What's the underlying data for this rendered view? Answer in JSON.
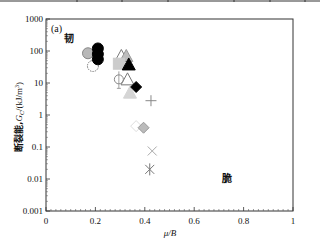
{
  "chart_data": {
    "type": "scatter",
    "panel_label": "(a)",
    "title": "",
    "xlabel": "μ/B",
    "ylabel": "断裂能,Gc/(kJ/m²)",
    "ylabel_prefix": "断裂能,",
    "ylabel_symbol": "G",
    "ylabel_subscript": "C",
    "ylabel_unit": "/(kJ/m",
    "ylabel_sup": "3",
    "ylabel_close": ")",
    "xlim": [
      0,
      1
    ],
    "ylim": [
      0.001,
      1000
    ],
    "yscale": "log",
    "grid": false,
    "legend": "none",
    "x_ticks": [
      "0",
      "0.2",
      "0.4",
      "0.6",
      "0.8",
      "1"
    ],
    "y_ticks": [
      "0.001",
      "0.01",
      "0.1",
      "1",
      "10",
      "100",
      "1000"
    ],
    "annotations": [
      {
        "text": "韧",
        "x": 0.09,
        "y": 200,
        "meaning": "ductile"
      },
      {
        "text": "脆",
        "x": 0.71,
        "y": 0.025,
        "meaning": "brittle"
      }
    ],
    "series": [
      {
        "name": "gray-filled-circle",
        "marker": "circle",
        "fill": "#b8b8b8",
        "stroke": "#888888",
        "points": [
          {
            "x": 0.17,
            "y": 85
          }
        ]
      },
      {
        "name": "open-circle-dashed",
        "marker": "circle",
        "fill": "none",
        "stroke": "#777777",
        "points": [
          {
            "x": 0.19,
            "y": 34
          }
        ]
      },
      {
        "name": "black-filled-circle",
        "marker": "circle",
        "fill": "#000000",
        "stroke": "#000000",
        "points": [
          {
            "x": 0.21,
            "y": 120
          },
          {
            "x": 0.21,
            "y": 80
          },
          {
            "x": 0.21,
            "y": 55
          }
        ]
      },
      {
        "name": "open-triangle",
        "marker": "triangle",
        "fill": "none",
        "stroke": "#777777",
        "points": [
          {
            "x": 0.305,
            "y": 70
          },
          {
            "x": 0.33,
            "y": 13
          }
        ]
      },
      {
        "name": "gray-filled-triangle",
        "marker": "triangle",
        "fill": "#bdbdbd",
        "stroke": "#999999",
        "points": [
          {
            "x": 0.325,
            "y": 70
          }
        ]
      },
      {
        "name": "gray-filled-square",
        "marker": "square",
        "fill": "#cccccc",
        "stroke": "#cccccc",
        "points": [
          {
            "x": 0.295,
            "y": 40
          }
        ]
      },
      {
        "name": "black-filled-triangle",
        "marker": "triangle",
        "fill": "#000000",
        "stroke": "#000000",
        "points": [
          {
            "x": 0.335,
            "y": 38
          }
        ]
      },
      {
        "name": "open-circle-errorbar",
        "marker": "circle-errorbar",
        "fill": "none",
        "stroke": "#888888",
        "points": [
          {
            "x": 0.295,
            "y": 13
          }
        ]
      },
      {
        "name": "light-gray-triangle",
        "marker": "triangle",
        "fill": "#d5d5d5",
        "stroke": "#d5d5d5",
        "points": [
          {
            "x": 0.34,
            "y": 5
          }
        ]
      },
      {
        "name": "black-filled-diamond",
        "marker": "diamond",
        "fill": "#000000",
        "stroke": "#000000",
        "points": [
          {
            "x": 0.365,
            "y": 7.5
          }
        ]
      },
      {
        "name": "plus",
        "marker": "plus",
        "fill": "none",
        "stroke": "#888888",
        "points": [
          {
            "x": 0.425,
            "y": 2.8
          }
        ]
      },
      {
        "name": "open-diamond-light",
        "marker": "diamond",
        "fill": "none",
        "stroke": "#dddddd",
        "points": [
          {
            "x": 0.365,
            "y": 0.45
          }
        ]
      },
      {
        "name": "gray-diamond",
        "marker": "diamond",
        "fill": "#bbbbbb",
        "stroke": "#999999",
        "points": [
          {
            "x": 0.395,
            "y": 0.4
          }
        ]
      },
      {
        "name": "x-cross",
        "marker": "x",
        "fill": "none",
        "stroke": "#aaaaaa",
        "points": [
          {
            "x": 0.43,
            "y": 0.075
          }
        ]
      },
      {
        "name": "asterisk",
        "marker": "asterisk",
        "fill": "none",
        "stroke": "#777777",
        "points": [
          {
            "x": 0.42,
            "y": 0.02
          }
        ]
      }
    ]
  },
  "labels": {
    "panel": "(a)",
    "ductile": "韧",
    "brittle": "脆",
    "xlabel": "μ/B"
  }
}
